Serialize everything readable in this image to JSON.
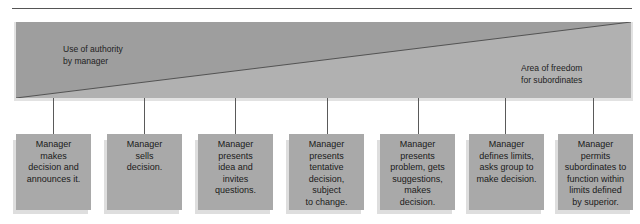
{
  "diagram": {
    "type": "continuum-of-leadership-behavior",
    "colors": {
      "manager_area": "#9d9d9d",
      "subordinate_area": "#b0b0b0",
      "box_fill": "#a9a9a9",
      "diagonal": "#4a4a4a"
    },
    "labels": {
      "manager_area": [
        "Use of authority",
        "by manager"
      ],
      "subordinate_area": [
        "Area of freedom",
        "for subordinates"
      ]
    },
    "behaviors": [
      {
        "lines": [
          "Manager",
          "makes",
          "decision and",
          "announces it."
        ]
      },
      {
        "lines": [
          "Manager",
          "sells",
          "decision."
        ]
      },
      {
        "lines": [
          "Manager",
          "presents",
          "idea and",
          "invites",
          "questions."
        ]
      },
      {
        "lines": [
          "Manager",
          "presents",
          "tentative",
          "decision,",
          "subject",
          "to change."
        ]
      },
      {
        "lines": [
          "Manager",
          "presents",
          "problem, gets",
          "suggestions,",
          "makes",
          "decision."
        ]
      },
      {
        "lines": [
          "Manager",
          "defines limits,",
          "asks group to",
          "make decision."
        ]
      },
      {
        "lines": [
          "Manager",
          "permits",
          "subordinates to",
          "function within",
          "limits defined",
          "by superior."
        ]
      }
    ]
  }
}
